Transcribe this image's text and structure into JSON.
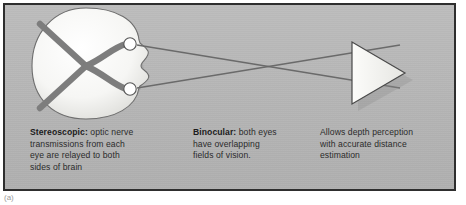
{
  "figure": {
    "sublabel": "(a)",
    "frame_color": "#2e2e2e",
    "panel_color": "#b9b9b9"
  },
  "diagram": {
    "title_implicit": "Binocular and stereoscopic vision",
    "head": {
      "name": "head-top-view",
      "fill": "#f4f4f2",
      "outline": "#6e6e6e",
      "description": "top view of head with nose pointing right"
    },
    "optic_chiasm": {
      "name": "optic-chiasm",
      "stroke": "#7d7d7d",
      "description": "X shaped crossing of optic nerves inside brain"
    },
    "eyes": [
      {
        "name": "eye-upper",
        "fill": "#ffffff",
        "outline": "#555555"
      },
      {
        "name": "eye-lower",
        "fill": "#ffffff",
        "outline": "#555555"
      }
    ],
    "sight_lines": {
      "name": "sight-lines",
      "stroke": "#6a6a6a",
      "count": 2,
      "description": "lines of sight from each eye crossing before the object"
    },
    "object": {
      "name": "viewed-object-triangle",
      "fill": "#f2f2f0",
      "outline": "#4a4a4a",
      "description": "right pointing triangle representing viewed object"
    }
  },
  "captions": {
    "stereoscopic": {
      "lead": "Stereoscopic:",
      "body": " optic nerve\ntransmissions from each\neye are relayed to both\nsides of brain"
    },
    "binocular": {
      "lead": "Binocular:",
      "body": " both eyes\nhave overlapping\nfields of vision."
    },
    "depth": {
      "lead": "",
      "body": "Allows depth perception\nwith accurate distance\nestimation"
    }
  }
}
